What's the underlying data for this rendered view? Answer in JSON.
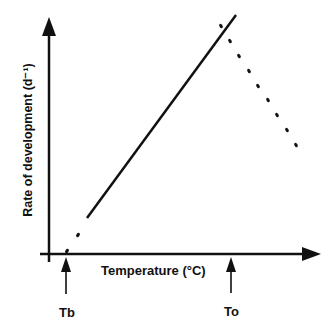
{
  "diagram": {
    "y_axis_label": "Rate of development (d⁻¹)",
    "x_axis_label": "Temperature (°C)",
    "markers": [
      {
        "label": "Tb",
        "meaning": "base temperature"
      },
      {
        "label": "To",
        "meaning": "optimum temperature"
      }
    ],
    "line_color": "#111111",
    "background": "#ffffff"
  }
}
